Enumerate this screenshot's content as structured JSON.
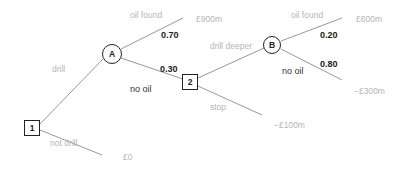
{
  "diagram": {
    "type": "decision-tree",
    "nodes": {
      "decision_1": {
        "label": "1",
        "kind": "decision"
      },
      "chance_A": {
        "label": "A",
        "kind": "chance"
      },
      "decision_2": {
        "label": "2",
        "kind": "decision"
      },
      "chance_B": {
        "label": "B",
        "kind": "chance"
      }
    },
    "branches": {
      "drill": "drill",
      "not_drill": "not drill",
      "a_oil_found": "oil found",
      "a_no_oil": "no oil",
      "drill_deeper": "drill deeper",
      "stop": "stop",
      "b_oil_found": "oil found",
      "b_no_oil": "no oil"
    },
    "probabilities": {
      "a_oil_found": "0.70",
      "a_no_oil": "0.30",
      "b_oil_found": "0.20",
      "b_no_oil": "0.80"
    },
    "payoffs": {
      "a_oil_found": "£900m",
      "b_oil_found": "£600m",
      "b_no_oil": "−£300m",
      "stop": "−£100m",
      "not_drill": "£0"
    },
    "colors": {
      "line": "#8c8c8c",
      "node_border": "#222222",
      "faded_text": "#b5b5b5",
      "bold_text": "#222222"
    }
  }
}
